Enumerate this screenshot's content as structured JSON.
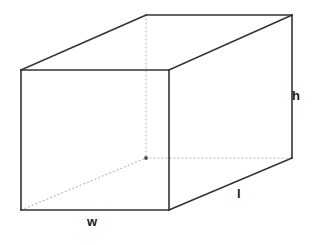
{
  "figure": {
    "name": "rectangular-prism-diagram",
    "background_color": "#ffffff",
    "width": 315,
    "height": 245
  },
  "labels": {
    "height": "h",
    "length": "l",
    "width": "w"
  },
  "style": {
    "visible_edge_color": "#333333",
    "hidden_edge_color": "#b3b3b3",
    "visible_edge_width": 1.6,
    "hidden_edge_width": 1.1,
    "hidden_edge_dash": "1,3",
    "vertex_dot_color": "#4d4d4d",
    "label_color": "#1a1a1a"
  },
  "geometry": {
    "vertices": {
      "front_top_left": [
        21,
        70
      ],
      "front_top_right": [
        169,
        70
      ],
      "front_bottom_right": [
        169,
        210
      ],
      "front_bottom_left": [
        21,
        210
      ],
      "back_top_left": [
        146,
        15
      ],
      "back_top_right": [
        292,
        15
      ],
      "back_bottom_right": [
        292,
        158
      ],
      "back_bottom_left_hidden": [
        146,
        158
      ]
    },
    "visible_edges": [
      {
        "name": "front-top-edge",
        "from": [
          21,
          70
        ],
        "to": [
          169,
          70
        ]
      },
      {
        "name": "front-right-edge",
        "from": [
          169,
          70
        ],
        "to": [
          169,
          210
        ]
      },
      {
        "name": "front-bottom-edge",
        "from": [
          169,
          210
        ],
        "to": [
          21,
          210
        ]
      },
      {
        "name": "front-left-edge",
        "from": [
          21,
          210
        ],
        "to": [
          21,
          70
        ]
      },
      {
        "name": "top-left-receding-edge",
        "from": [
          21,
          70
        ],
        "to": [
          146,
          15
        ]
      },
      {
        "name": "back-top-edge",
        "from": [
          146,
          15
        ],
        "to": [
          292,
          15
        ]
      },
      {
        "name": "top-right-receding-edge",
        "from": [
          169,
          70
        ],
        "to": [
          292,
          15
        ]
      },
      {
        "name": "back-right-vertical-edge",
        "from": [
          292,
          15
        ],
        "to": [
          292,
          158
        ]
      },
      {
        "name": "bottom-right-receding-edge",
        "from": [
          292,
          158
        ],
        "to": [
          169,
          210
        ]
      }
    ],
    "hidden_edges": [
      {
        "name": "hidden-back-left-vertical-edge",
        "from": [
          146,
          15
        ],
        "to": [
          146,
          158
        ]
      },
      {
        "name": "hidden-back-bottom-edge",
        "from": [
          146,
          158
        ],
        "to": [
          292,
          158
        ]
      },
      {
        "name": "hidden-bottom-left-receding-edge",
        "from": [
          21,
          210
        ],
        "to": [
          146,
          158
        ]
      }
    ],
    "hidden_vertex_dot": [
      146,
      158
    ]
  }
}
